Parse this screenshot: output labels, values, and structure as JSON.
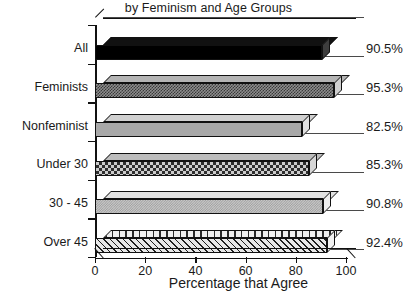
{
  "chart_data": {
    "type": "bar",
    "orientation": "horizontal",
    "style": "3d",
    "title": "by Feminism and Age Groups",
    "xlabel": "Percentage that Agree",
    "ylabel": "",
    "categories": [
      "All",
      "Feminists",
      "Nonfeminist",
      "Under 30",
      "30 - 45",
      "Over 45"
    ],
    "values": [
      90.5,
      95.3,
      82.5,
      85.3,
      90.8,
      92.4
    ],
    "value_labels": [
      "90.5%",
      "95.3%",
      "82.5%",
      "85.3%",
      "90.8%",
      "92.4%"
    ],
    "xlim": [
      0,
      110
    ],
    "xticks": [
      0,
      20,
      40,
      60,
      80,
      100
    ],
    "xtick_labels": [
      "0",
      "20",
      "40",
      "60",
      "80",
      "100"
    ],
    "grid": false,
    "legend": "none",
    "series": [
      {
        "name": "Percentage that Agree",
        "points": [
          {
            "category": "All",
            "value": 90.5,
            "label": "90.5%",
            "fill": "solid-black"
          },
          {
            "category": "Feminists",
            "value": 95.3,
            "label": "95.3%",
            "fill": "check-med"
          },
          {
            "category": "Nonfeminist",
            "value": 82.5,
            "label": "82.5%",
            "fill": "solid-gray"
          },
          {
            "category": "Under 30",
            "value": 85.3,
            "label": "85.3%",
            "fill": "check-coarse"
          },
          {
            "category": "30 - 45",
            "value": 90.8,
            "label": "90.8%",
            "fill": "dots-light"
          },
          {
            "category": "Over 45",
            "value": 92.4,
            "label": "92.4%",
            "fill": "diag-hatch"
          }
        ]
      }
    ]
  },
  "colors": {
    "axis": "#111111",
    "text": "#1a1a1a",
    "background": "#ffffff"
  }
}
